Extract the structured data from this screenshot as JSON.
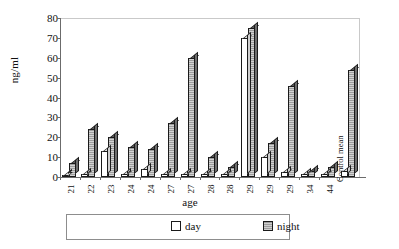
{
  "chart_data": {
    "type": "bar",
    "title": "",
    "xlabel": "age",
    "ylabel": "ng/ml",
    "ylim": [
      0,
      80
    ],
    "yticks": [
      0,
      10,
      20,
      30,
      40,
      50,
      60,
      70,
      80
    ],
    "grid": false,
    "legend_position": "bottom",
    "categories": [
      "21",
      "22",
      "23",
      "24",
      "24",
      "27",
      "27",
      "28",
      "28",
      "29",
      "29",
      "29",
      "34",
      "44",
      "Control mean"
    ],
    "series": [
      {
        "name": "day",
        "values": [
          1,
          1.5,
          13,
          1.5,
          4,
          1.5,
          1.5,
          1.5,
          1.5,
          70,
          10,
          2.5,
          1.5,
          1.5,
          3
        ]
      },
      {
        "name": "night",
        "values": [
          7,
          24,
          20,
          15,
          14,
          27,
          60,
          10,
          5,
          75,
          17,
          46,
          3,
          5,
          54
        ]
      }
    ],
    "annotations": [
      "Control mean"
    ]
  },
  "axes": {
    "ylabel": "ng/ml",
    "xlabel": "age",
    "ytick_labels": [
      "80",
      "70",
      "60",
      "50",
      "40",
      "30",
      "20",
      "10",
      "0"
    ]
  },
  "legend": {
    "items": [
      {
        "label": "day",
        "swatch": "open-square-white"
      },
      {
        "label": "night",
        "swatch": "filled-square-gray"
      }
    ]
  },
  "side_label": {
    "text": "Control mean"
  },
  "colors": {
    "day_fill": "#ffffff",
    "night_fill": "#9d9d9d",
    "bar_outline": "#1a1a1a",
    "axis": "#6b6b6b",
    "background": "#ffffff"
  }
}
